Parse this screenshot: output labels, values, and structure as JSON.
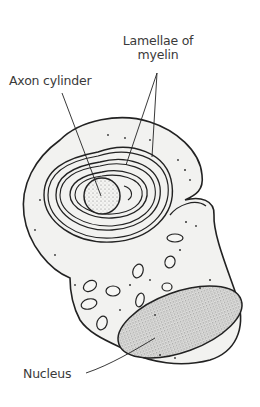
{
  "figure": {
    "labels": {
      "lamellae_line1": "Lamellae of",
      "lamellae_line2": "myelin",
      "axon": "Axon cylinder",
      "nucleus": "Nucleus"
    },
    "colors": {
      "background": "#ffffff",
      "cell_fill": "#f2f2f0",
      "outline": "#222222",
      "stipple": "#8a8a8a",
      "text": "#3a3a3a"
    }
  }
}
